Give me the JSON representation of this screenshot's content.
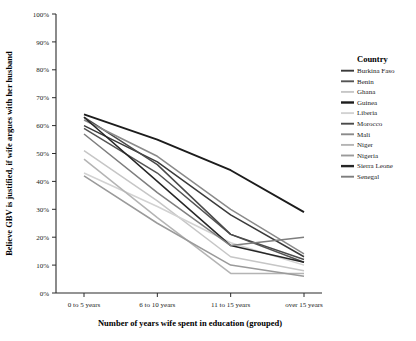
{
  "chart_data": {
    "type": "line",
    "title": "",
    "xlabel": "Number of years wife spent in education (grouped)",
    "ylabel": "Believe GBV is justified, if wife argues with her husband",
    "categories": [
      "0 to 5 years",
      "6 to 10 years",
      "11 to 15 years",
      "over 15 years"
    ],
    "ylim": [
      0,
      100
    ],
    "yticks": [
      "0%",
      "10%",
      "20%",
      "30%",
      "40%",
      "50%",
      "60%",
      "70%",
      "80%",
      "90%",
      "100%"
    ],
    "grid": false,
    "legend_position": "right",
    "legend_title": "Country",
    "value_unit": "%",
    "series": [
      {
        "name": "Burkina Faso",
        "color": "#3a3a3a",
        "values": [
          60,
          47,
          28,
          13
        ]
      },
      {
        "name": "Benin",
        "color": "#545454",
        "values": [
          59,
          43,
          21,
          11
        ]
      },
      {
        "name": "Ghana",
        "color": "#c6c6c6",
        "values": [
          51,
          33,
          13,
          8
        ]
      },
      {
        "name": "Guinea",
        "color": "#1c1c1c",
        "values": [
          64,
          55,
          44,
          29
        ]
      },
      {
        "name": "Liberia",
        "color": "#d2d2d2",
        "values": [
          43,
          31,
          18,
          10
        ]
      },
      {
        "name": "Morocco",
        "color": "#4a4a4a",
        "values": [
          63,
          46,
          21,
          12
        ]
      },
      {
        "name": "Mali",
        "color": "#8a8a8a",
        "values": [
          62,
          49,
          30,
          14
        ]
      },
      {
        "name": "Niger",
        "color": "#b4b4b4",
        "values": [
          48,
          27,
          7,
          7
        ]
      },
      {
        "name": "Nigeria",
        "color": "#9a9a9a",
        "values": [
          42,
          25,
          10,
          6
        ]
      },
      {
        "name": "Sierra Leone",
        "color": "#262626",
        "values": [
          63,
          40,
          17,
          11
        ]
      },
      {
        "name": "Senegal",
        "color": "#7e7e7e",
        "values": [
          57,
          36,
          17,
          20
        ]
      }
    ]
  }
}
